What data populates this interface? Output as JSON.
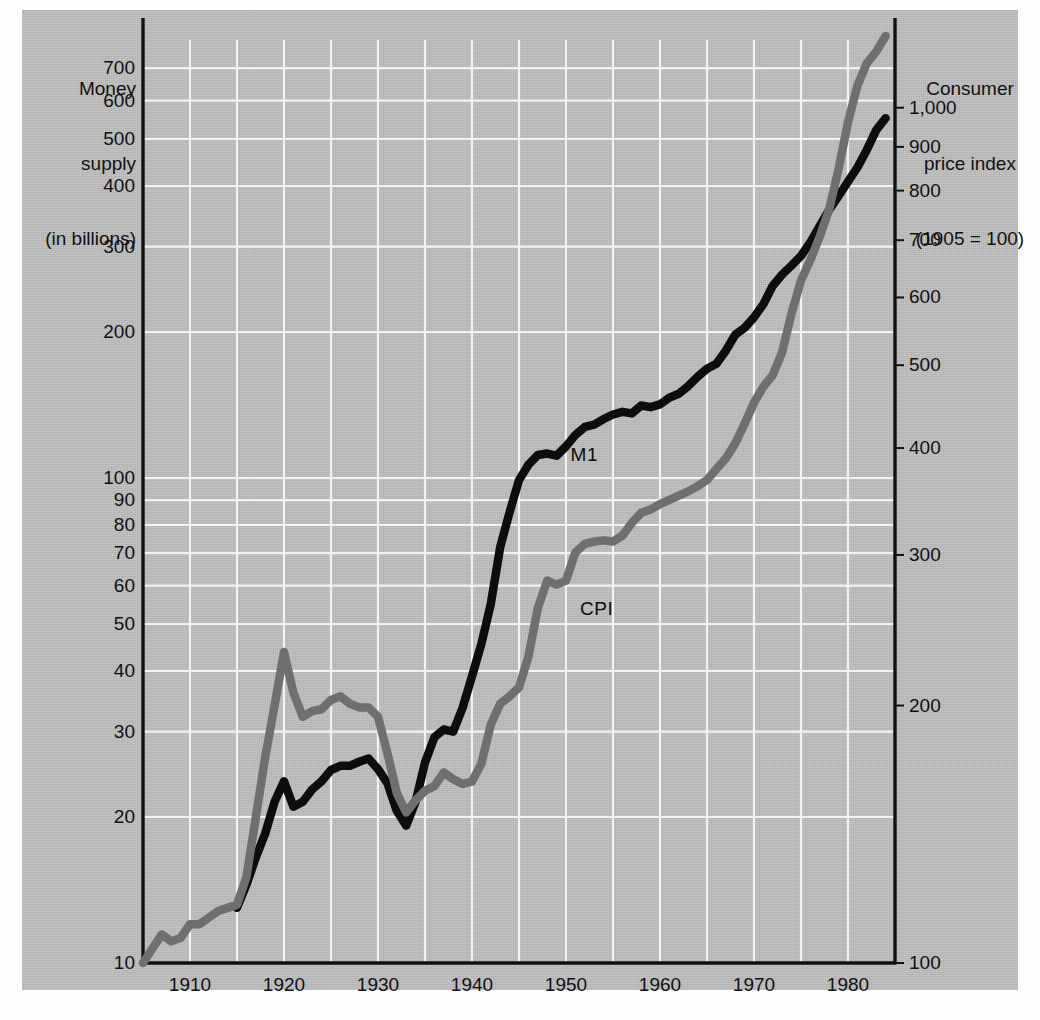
{
  "figure": {
    "background_color": "#bfbfbf",
    "paper_color": "#fdfdfd"
  },
  "left_axis": {
    "title_line1": "Money",
    "title_line2": "supply",
    "title_line3": "(in billions)",
    "scale": "log",
    "ticks": [
      {
        "label": "700",
        "value": 700
      },
      {
        "label": "600",
        "value": 600
      },
      {
        "label": "500",
        "value": 500
      },
      {
        "label": "400",
        "value": 400
      },
      {
        "label": "300",
        "value": 300
      },
      {
        "label": "200",
        "value": 200
      },
      {
        "label": "100",
        "value": 100
      },
      {
        "label": "90",
        "value": 90
      },
      {
        "label": "80",
        "value": 80
      },
      {
        "label": "70",
        "value": 70
      },
      {
        "label": "60",
        "value": 60
      },
      {
        "label": "50",
        "value": 50
      },
      {
        "label": "40",
        "value": 40
      },
      {
        "label": "30",
        "value": 30
      },
      {
        "label": "20",
        "value": 20
      },
      {
        "label": "10",
        "value": 10
      }
    ]
  },
  "right_axis": {
    "title_line1": "Consumer",
    "title_line2": "price index",
    "title_line3": "(1905 = 100)",
    "scale": "log",
    "ticks": [
      {
        "label": "1,000",
        "value": 1000
      },
      {
        "label": "900",
        "value": 900
      },
      {
        "label": "800",
        "value": 800
      },
      {
        "label": "700",
        "value": 700
      },
      {
        "label": "600",
        "value": 600
      },
      {
        "label": "500",
        "value": 500
      },
      {
        "label": "400",
        "value": 400
      },
      {
        "label": "300",
        "value": 300
      },
      {
        "label": "200",
        "value": 200
      },
      {
        "label": "100",
        "value": 100
      }
    ]
  },
  "x_axis": {
    "ticks": [
      "1910",
      "1920",
      "1930",
      "1940",
      "1950",
      "1960",
      "1970",
      "1980"
    ],
    "tick_values": [
      1910,
      1920,
      1930,
      1940,
      1950,
      1960,
      1970,
      1980
    ],
    "range": [
      1905,
      1985
    ],
    "gridline_interval_years": 5
  },
  "series_labels": {
    "m1": "M1",
    "cpi": "CPI"
  },
  "chart_data": {
    "type": "line",
    "title": "",
    "subtitle": "",
    "xlabel": "",
    "ylabel": "Money supply (in billions)",
    "y2label": "Consumer price index (1905 = 100)",
    "grid": true,
    "legend": "inline-annotations",
    "xlim": [
      1905,
      1985
    ],
    "ylim": [
      10,
      800
    ],
    "y2lim": [
      100,
      1200
    ],
    "yscale": "log",
    "y2scale": "log",
    "series": [
      {
        "name": "M1",
        "axis": "left",
        "color": "#0d0d0d",
        "units": "billions of dollars",
        "label_position": {
          "x": 1949,
          "y": 112
        },
        "x": [
          1915,
          1916,
          1917,
          1918,
          1919,
          1920,
          1921,
          1922,
          1923,
          1924,
          1925,
          1926,
          1927,
          1928,
          1929,
          1930,
          1931,
          1932,
          1933,
          1934,
          1935,
          1936,
          1937,
          1938,
          1939,
          1940,
          1941,
          1942,
          1943,
          1944,
          1945,
          1946,
          1947,
          1948,
          1949,
          1950,
          1951,
          1952,
          1953,
          1954,
          1955,
          1956,
          1957,
          1958,
          1959,
          1960,
          1961,
          1962,
          1963,
          1964,
          1965,
          1966,
          1967,
          1968,
          1969,
          1970,
          1971,
          1972,
          1973,
          1974,
          1975,
          1976,
          1977,
          1978,
          1979,
          1980,
          1981,
          1982,
          1983,
          1984
        ],
        "values": [
          13.0,
          14.5,
          16.5,
          18.5,
          21.5,
          23.7,
          21.0,
          21.5,
          22.8,
          23.7,
          25.0,
          25.5,
          25.5,
          26.0,
          26.4,
          25.1,
          23.5,
          20.6,
          19.2,
          21.5,
          25.9,
          29.2,
          30.3,
          30.0,
          33.6,
          39.0,
          45.5,
          55.0,
          72.0,
          85.0,
          99.0,
          106.5,
          111.5,
          112.3,
          111.2,
          116.2,
          122.7,
          127.4,
          128.8,
          132.3,
          135.2,
          136.9,
          135.9,
          141.1,
          140.0,
          141.8,
          146.5,
          149.2,
          154.7,
          161.8,
          168.0,
          172.0,
          183.0,
          197.4,
          203.9,
          214.4,
          228.3,
          249.2,
          262.8,
          274.2,
          287.1,
          306.2,
          330.9,
          357.3,
          381.8,
          408.5,
          436.7,
          474.8,
          521.4,
          552.0
        ]
      },
      {
        "name": "CPI",
        "axis": "right",
        "color": "#6f6f6f",
        "units": "index, 1905 = 100",
        "label_position": {
          "x": 1950,
          "y": 260
        },
        "x": [
          1905,
          1906,
          1907,
          1908,
          1909,
          1910,
          1911,
          1912,
          1913,
          1914,
          1915,
          1916,
          1917,
          1918,
          1919,
          1920,
          1921,
          1922,
          1923,
          1924,
          1925,
          1926,
          1927,
          1928,
          1929,
          1930,
          1931,
          1932,
          1933,
          1934,
          1935,
          1936,
          1937,
          1938,
          1939,
          1940,
          1941,
          1942,
          1943,
          1944,
          1945,
          1946,
          1947,
          1948,
          1949,
          1950,
          1951,
          1952,
          1953,
          1954,
          1955,
          1956,
          1957,
          1958,
          1959,
          1960,
          1961,
          1962,
          1963,
          1964,
          1965,
          1966,
          1967,
          1968,
          1969,
          1970,
          1971,
          1972,
          1973,
          1974,
          1975,
          1976,
          1977,
          1978,
          1979,
          1980,
          1981,
          1982,
          1983,
          1984
        ],
        "values": [
          100,
          104,
          108,
          106,
          107,
          111,
          111,
          113,
          115,
          116,
          117,
          126,
          148,
          174,
          200,
          231,
          207,
          194,
          197,
          198,
          203,
          205,
          201,
          199,
          199,
          194,
          176,
          158,
          150,
          155,
          159,
          161,
          167,
          164,
          162,
          163,
          171,
          190,
          201,
          205,
          210,
          228,
          260,
          280,
          277,
          280,
          302,
          309,
          311,
          312,
          311,
          316,
          327,
          336,
          339,
          344,
          348,
          352,
          356,
          361,
          367,
          378,
          389,
          405,
          427,
          452,
          472,
          487,
          518,
          575,
          628,
          664,
          707,
          761,
          848,
          962,
          1061,
          1127,
          1163,
          1213
        ]
      }
    ]
  }
}
